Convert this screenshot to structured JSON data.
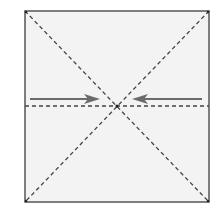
{
  "diagram": {
    "type": "origami-fold-instruction",
    "colors": {
      "paper": "#f3f3f3",
      "border": "#555555",
      "fold_line": "#444444",
      "arrow": "#6b6b6b",
      "background": "#ffffff"
    },
    "square": {
      "x1": 25,
      "y1": 11,
      "x2": 209,
      "y2": 202
    },
    "lines": [
      {
        "name": "diagonal-top-left-to-bottom-right",
        "style": "dashed"
      },
      {
        "name": "diagonal-top-right-to-bottom-left",
        "style": "dashed"
      },
      {
        "name": "horizontal-center-fold",
        "style": "dashed"
      }
    ],
    "arrows": [
      {
        "name": "left-arrow",
        "direction": "right",
        "from_x": 30,
        "to_x": 100,
        "y": 99
      },
      {
        "name": "right-arrow",
        "direction": "left",
        "from_x": 202,
        "to_x": 132,
        "y": 99
      }
    ],
    "center_point": {
      "x": 117,
      "y": 106
    }
  }
}
